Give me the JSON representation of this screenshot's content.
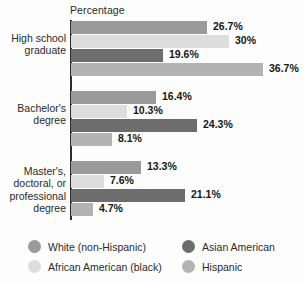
{
  "chart_data": {
    "type": "bar",
    "orientation": "horizontal",
    "title": "",
    "xlabel": "Percentage",
    "ylabel": "",
    "grid": false,
    "legend_position": "bottom-left",
    "categories": [
      "High school graduate",
      "Bachelor's degree",
      "Master's, doctoral, or professional degree"
    ],
    "series": [
      {
        "name": "White (non-Hispanic)",
        "color": "#9a9a9a",
        "values": [
          26.7,
          16.4,
          13.3
        ],
        "labels": [
          "26.7%",
          "16.4%",
          "13.3%"
        ]
      },
      {
        "name": "African American (black)",
        "color": "#dddddd",
        "values": [
          30,
          10.3,
          7.6
        ],
        "labels": [
          "30%",
          "10.3%",
          "7.6%"
        ]
      },
      {
        "name": "Asian American",
        "color": "#6d6d6d",
        "values": [
          19.6,
          24.3,
          21.1
        ],
        "labels": [
          "19.6%",
          "24.3%",
          "21.1%"
        ]
      },
      {
        "name": "Hispanic",
        "color": "#b3b3b3",
        "values": [
          36.7,
          8.1,
          4.7
        ],
        "labels": [
          "36.7%",
          "8.1%",
          "4.7%"
        ]
      }
    ],
    "bar_pixel_widths": [
      [
        136,
        85,
        70
      ],
      [
        158,
        56,
        33
      ],
      [
        92,
        126,
        114
      ],
      [
        192,
        41,
        22
      ]
    ]
  },
  "axis": {
    "percentage_label": "Percentage"
  },
  "categories": [
    {
      "lines": [
        "High school",
        "graduate"
      ]
    },
    {
      "lines": [
        "Bachelor's",
        "degree"
      ]
    },
    {
      "lines": [
        "Master's,",
        "doctoral, or",
        "professional",
        "degree"
      ]
    }
  ],
  "legend": {
    "items": [
      {
        "label": "White (non-Hispanic)",
        "color": "#9a9a9a"
      },
      {
        "label": "African American (black)",
        "color": "#dddddd"
      },
      {
        "label": "Asian American",
        "color": "#6d6d6d"
      },
      {
        "label": "Hispanic",
        "color": "#b3b3b3"
      }
    ]
  }
}
